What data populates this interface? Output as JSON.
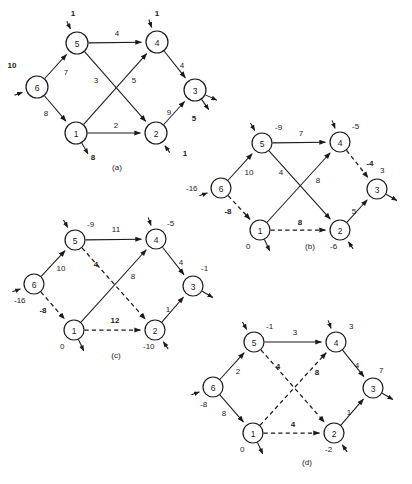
{
  "figure": {
    "background": "#ffffff",
    "ink": "#1a1a1a",
    "width": 412,
    "height": 484
  },
  "chart_data": {
    "type": "diagram",
    "title": "",
    "subtitle": "",
    "node_ids": [
      "1",
      "2",
      "3",
      "4",
      "5",
      "6"
    ],
    "panels": [
      {
        "key": "a",
        "caption": "(a)",
        "caption_x": 117,
        "caption_y": 167,
        "origin_x": 0,
        "origin_y": 0,
        "nodes": [
          {
            "id": "5",
            "label": "5",
            "x": 77,
            "y": 43,
            "r": 11
          },
          {
            "id": "4",
            "label": "4",
            "x": 157,
            "y": 42,
            "r": 11
          },
          {
            "id": "6",
            "label": "6",
            "x": 37,
            "y": 87,
            "r": 11
          },
          {
            "id": "3",
            "label": "3",
            "x": 195,
            "y": 90,
            "r": 11
          },
          {
            "id": "1",
            "label": "1",
            "x": 76,
            "y": 133,
            "r": 11
          },
          {
            "id": "2",
            "label": "2",
            "x": 156,
            "y": 133,
            "r": 11
          }
        ],
        "edges": [
          {
            "from": "5",
            "to": "4",
            "style": "solid",
            "label": "4",
            "bold": false,
            "lx": 117,
            "ly": 33
          },
          {
            "from": "6",
            "to": "5",
            "style": "solid",
            "label": "7",
            "bold": false,
            "lx": 66,
            "ly": 72
          },
          {
            "from": "6",
            "to": "1",
            "style": "solid",
            "label": "8",
            "bold": false,
            "lx": 46,
            "ly": 113
          },
          {
            "from": "5",
            "to": "2",
            "style": "solid",
            "label": "3",
            "bold": false,
            "lx": 96,
            "ly": 80
          },
          {
            "from": "1",
            "to": "4",
            "style": "solid",
            "label": "5",
            "bold": false,
            "lx": 134,
            "ly": 80
          },
          {
            "from": "4",
            "to": "3",
            "style": "solid",
            "label": "4",
            "bold": false,
            "lx": 182,
            "ly": 65
          },
          {
            "from": "2",
            "to": "3",
            "style": "solid",
            "label": "9",
            "bold": false,
            "lx": 169,
            "ly": 112
          },
          {
            "from": "1",
            "to": "2",
            "style": "solid",
            "label": "2",
            "bold": false,
            "lx": 116,
            "ly": 125
          }
        ],
        "externals": [
          {
            "node": "5",
            "dir": "in",
            "angle": -115,
            "label": "1",
            "bold": true,
            "lx": 73,
            "ly": 13
          },
          {
            "node": "4",
            "dir": "in",
            "angle": -110,
            "label": "1",
            "bold": true,
            "lx": 157,
            "ly": 13
          },
          {
            "node": "6",
            "dir": "in",
            "angle": 160,
            "label": "10",
            "bold": true,
            "lx": 12,
            "ly": 65
          },
          {
            "node": "3",
            "dir": "out",
            "angle": 25,
            "label": "5",
            "bold": true,
            "lx": 194,
            "ly": 118
          },
          {
            "node": "3",
            "dir": "out",
            "angle": 55,
            "label": "",
            "bold": false,
            "lx": 0,
            "ly": 0
          },
          {
            "node": "1",
            "dir": "out",
            "angle": 60,
            "label": "8",
            "bold": true,
            "lx": 93,
            "ly": 157
          },
          {
            "node": "2",
            "dir": "in",
            "angle": 55,
            "label": "1",
            "bold": true,
            "lx": 185,
            "ly": 153
          }
        ],
        "node_values": []
      },
      {
        "key": "b",
        "caption": "(b)",
        "caption_x": 310,
        "caption_y": 246,
        "origin_x": 0,
        "origin_y": 0,
        "nodes": [
          {
            "id": "5",
            "label": "5",
            "x": 262,
            "y": 143,
            "r": 10
          },
          {
            "id": "4",
            "label": "4",
            "x": 340,
            "y": 142,
            "r": 10
          },
          {
            "id": "6",
            "label": "6",
            "x": 221,
            "y": 188,
            "r": 10
          },
          {
            "id": "3",
            "label": "3",
            "x": 377,
            "y": 189,
            "r": 10
          },
          {
            "id": "1",
            "label": "1",
            "x": 260,
            "y": 230,
            "r": 10
          },
          {
            "id": "2",
            "label": "2",
            "x": 340,
            "y": 230,
            "r": 10
          }
        ],
        "edges": [
          {
            "from": "5",
            "to": "4",
            "style": "solid",
            "label": "7",
            "bold": false,
            "lx": 301,
            "ly": 133
          },
          {
            "from": "6",
            "to": "5",
            "style": "solid",
            "label": "10",
            "bold": false,
            "lx": 249,
            "ly": 172
          },
          {
            "from": "6",
            "to": "1",
            "style": "dashed",
            "label": "-8",
            "bold": true,
            "lx": 228,
            "ly": 211
          },
          {
            "from": "5",
            "to": "2",
            "style": "solid",
            "label": "4",
            "bold": false,
            "lx": 281,
            "ly": 172
          },
          {
            "from": "1",
            "to": "4",
            "style": "solid",
            "label": "8",
            "bold": false,
            "lx": 318,
            "ly": 180
          },
          {
            "from": "4",
            "to": "3",
            "style": "dashed",
            "label": "-4",
            "bold": true,
            "lx": 370,
            "ly": 163
          },
          {
            "from": "2",
            "to": "3",
            "style": "solid",
            "label": "5",
            "bold": false,
            "lx": 354,
            "ly": 211
          },
          {
            "from": "1",
            "to": "2",
            "style": "dashed",
            "label": "8",
            "bold": true,
            "lx": 300,
            "ly": 222
          }
        ],
        "externals": [
          {
            "node": "5",
            "dir": "in",
            "angle": -120,
            "label": "",
            "bold": false,
            "lx": 0,
            "ly": 0
          },
          {
            "node": "4",
            "dir": "in",
            "angle": -110,
            "label": "",
            "bold": false,
            "lx": 0,
            "ly": 0
          },
          {
            "node": "6",
            "dir": "in",
            "angle": 160,
            "label": "",
            "bold": false,
            "lx": 0,
            "ly": 0
          },
          {
            "node": "3",
            "dir": "out",
            "angle": 30,
            "label": "",
            "bold": false,
            "lx": 0,
            "ly": 0
          },
          {
            "node": "1",
            "dir": "out",
            "angle": 65,
            "label": "",
            "bold": false,
            "lx": 0,
            "ly": 0
          },
          {
            "node": "2",
            "dir": "in",
            "angle": 55,
            "label": "",
            "bold": false,
            "lx": 0,
            "ly": 0
          }
        ],
        "node_values": [
          {
            "node": "5",
            "text": "-9",
            "x": 275,
            "y": 127,
            "anchor": "start"
          },
          {
            "node": "4",
            "text": "-5",
            "x": 352,
            "y": 126,
            "anchor": "start"
          },
          {
            "node": "6",
            "text": "-16",
            "x": 186,
            "y": 188,
            "anchor": "start"
          },
          {
            "node": "3",
            "text": "3",
            "x": 380,
            "y": 170,
            "anchor": "start"
          },
          {
            "node": "1",
            "text": "0",
            "x": 246,
            "y": 246,
            "anchor": "start"
          },
          {
            "node": "2",
            "text": "-6",
            "x": 330,
            "y": 246,
            "anchor": "start"
          }
        ]
      },
      {
        "key": "c",
        "caption": "(c)",
        "caption_x": 116,
        "caption_y": 355,
        "origin_x": 0,
        "origin_y": 0,
        "nodes": [
          {
            "id": "5",
            "label": "5",
            "x": 75,
            "y": 240,
            "r": 10
          },
          {
            "id": "4",
            "label": "4",
            "x": 156,
            "y": 239,
            "r": 10
          },
          {
            "id": "6",
            "label": "6",
            "x": 34,
            "y": 284,
            "r": 10
          },
          {
            "id": "3",
            "label": "3",
            "x": 193,
            "y": 286,
            "r": 10
          },
          {
            "id": "1",
            "label": "1",
            "x": 74,
            "y": 330,
            "r": 10
          },
          {
            "id": "2",
            "label": "2",
            "x": 155,
            "y": 330,
            "r": 10
          }
        ],
        "edges": [
          {
            "from": "5",
            "to": "4",
            "style": "solid",
            "label": "11",
            "bold": false,
            "lx": 116,
            "ly": 229
          },
          {
            "from": "6",
            "to": "5",
            "style": "solid",
            "label": "10",
            "bold": false,
            "lx": 61,
            "ly": 268
          },
          {
            "from": "6",
            "to": "1",
            "style": "dashed",
            "label": "-8",
            "bold": true,
            "lx": 43,
            "ly": 310
          },
          {
            "from": "5",
            "to": "2",
            "style": "dashed",
            "label": "4",
            "bold": true,
            "lx": 96,
            "ly": 264
          },
          {
            "from": "1",
            "to": "4",
            "style": "solid",
            "label": "8",
            "bold": false,
            "lx": 133,
            "ly": 276
          },
          {
            "from": "4",
            "to": "3",
            "style": "solid",
            "label": "4",
            "bold": false,
            "lx": 181,
            "ly": 262
          },
          {
            "from": "2",
            "to": "3",
            "style": "solid",
            "label": "1",
            "bold": false,
            "lx": 168,
            "ly": 309
          },
          {
            "from": "1",
            "to": "2",
            "style": "dashed",
            "label": "12",
            "bold": true,
            "lx": 115,
            "ly": 320
          }
        ],
        "externals": [
          {
            "node": "5",
            "dir": "in",
            "angle": -120,
            "label": "",
            "bold": false,
            "lx": 0,
            "ly": 0
          },
          {
            "node": "4",
            "dir": "in",
            "angle": -110,
            "label": "",
            "bold": false,
            "lx": 0,
            "ly": 0
          },
          {
            "node": "6",
            "dir": "in",
            "angle": 160,
            "label": "",
            "bold": false,
            "lx": 0,
            "ly": 0
          },
          {
            "node": "3",
            "dir": "out",
            "angle": 30,
            "label": "",
            "bold": false,
            "lx": 0,
            "ly": 0
          },
          {
            "node": "1",
            "dir": "out",
            "angle": 65,
            "label": "",
            "bold": false,
            "lx": 0,
            "ly": 0
          },
          {
            "node": "2",
            "dir": "in",
            "angle": 55,
            "label": "",
            "bold": false,
            "lx": 0,
            "ly": 0
          }
        ],
        "node_values": [
          {
            "node": "5",
            "text": "-9",
            "x": 87,
            "y": 224,
            "anchor": "start"
          },
          {
            "node": "4",
            "text": "-5",
            "x": 167,
            "y": 223,
            "anchor": "start"
          },
          {
            "node": "6",
            "text": "-16",
            "x": 14,
            "y": 300,
            "anchor": "start"
          },
          {
            "node": "3",
            "text": "-1",
            "x": 201,
            "y": 268,
            "anchor": "start"
          },
          {
            "node": "1",
            "text": "0",
            "x": 60,
            "y": 346,
            "anchor": "start"
          },
          {
            "node": "2",
            "text": "-10",
            "x": 143,
            "y": 346,
            "anchor": "start"
          }
        ]
      },
      {
        "key": "d",
        "caption": "(d)",
        "caption_x": 307,
        "caption_y": 462,
        "origin_x": 0,
        "origin_y": 0,
        "nodes": [
          {
            "id": "5",
            "label": "5",
            "x": 254,
            "y": 342,
            "r": 10
          },
          {
            "id": "4",
            "label": "4",
            "x": 336,
            "y": 342,
            "r": 10
          },
          {
            "id": "6",
            "label": "6",
            "x": 213,
            "y": 387,
            "r": 10
          },
          {
            "id": "3",
            "label": "3",
            "x": 373,
            "y": 388,
            "r": 10
          },
          {
            "id": "1",
            "label": "1",
            "x": 253,
            "y": 433,
            "r": 10
          },
          {
            "id": "2",
            "label": "2",
            "x": 334,
            "y": 433,
            "r": 10
          }
        ],
        "edges": [
          {
            "from": "5",
            "to": "4",
            "style": "solid",
            "label": "3",
            "bold": false,
            "lx": 295,
            "ly": 332
          },
          {
            "from": "6",
            "to": "5",
            "style": "solid",
            "label": "2",
            "bold": false,
            "lx": 238,
            "ly": 371
          },
          {
            "from": "6",
            "to": "1",
            "style": "solid",
            "label": "8",
            "bold": false,
            "lx": 224,
            "ly": 413
          },
          {
            "from": "5",
            "to": "2",
            "style": "dashed",
            "label": "4",
            "bold": true,
            "lx": 278,
            "ly": 366
          },
          {
            "from": "1",
            "to": "4",
            "style": "dashed",
            "label": "8",
            "bold": true,
            "lx": 317,
            "ly": 372
          },
          {
            "from": "4",
            "to": "3",
            "style": "solid",
            "label": "4",
            "bold": false,
            "lx": 357,
            "ly": 365
          },
          {
            "from": "2",
            "to": "3",
            "style": "solid",
            "label": "1",
            "bold": false,
            "lx": 349,
            "ly": 412
          },
          {
            "from": "1",
            "to": "2",
            "style": "dashed",
            "label": "4",
            "bold": true,
            "lx": 293,
            "ly": 424
          }
        ],
        "externals": [
          {
            "node": "5",
            "dir": "in",
            "angle": -120,
            "label": "",
            "bold": false,
            "lx": 0,
            "ly": 0
          },
          {
            "node": "4",
            "dir": "in",
            "angle": -110,
            "label": "",
            "bold": false,
            "lx": 0,
            "ly": 0
          },
          {
            "node": "6",
            "dir": "in",
            "angle": 160,
            "label": "",
            "bold": false,
            "lx": 0,
            "ly": 0
          },
          {
            "node": "3",
            "dir": "out",
            "angle": 30,
            "label": "",
            "bold": false,
            "lx": 0,
            "ly": 0
          },
          {
            "node": "1",
            "dir": "out",
            "angle": 65,
            "label": "",
            "bold": false,
            "lx": 0,
            "ly": 0
          },
          {
            "node": "2",
            "dir": "in",
            "angle": 55,
            "label": "",
            "bold": false,
            "lx": 0,
            "ly": 0
          }
        ],
        "node_values": [
          {
            "node": "5",
            "text": "-1",
            "x": 266,
            "y": 326,
            "anchor": "start"
          },
          {
            "node": "4",
            "text": "3",
            "x": 349,
            "y": 326,
            "anchor": "start"
          },
          {
            "node": "6",
            "text": "-8",
            "x": 200,
            "y": 404,
            "anchor": "start"
          },
          {
            "node": "3",
            "text": "7",
            "x": 379,
            "y": 370,
            "anchor": "start"
          },
          {
            "node": "1",
            "text": "0",
            "x": 240,
            "y": 449,
            "anchor": "start"
          },
          {
            "node": "2",
            "text": "-2",
            "x": 325,
            "y": 449,
            "anchor": "start"
          }
        ]
      }
    ]
  }
}
